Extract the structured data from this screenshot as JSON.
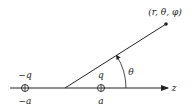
{
  "diagram": {
    "point_label": "(r, θ, φ)",
    "angle_label": "θ",
    "axis_label": "z",
    "charges": [
      {
        "charge_label": "−q",
        "position_label": "−a"
      },
      {
        "charge_label": "q",
        "position_label": "a"
      }
    ],
    "colors": {
      "stroke": "#222222",
      "background": "#ffffff"
    }
  }
}
